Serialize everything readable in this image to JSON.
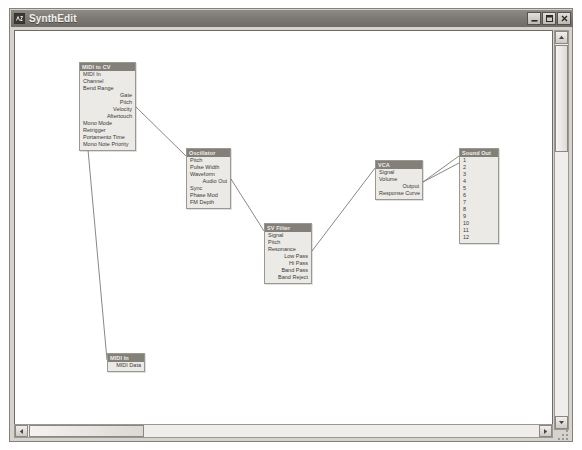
{
  "window": {
    "title": "SynthEdit",
    "icon": "app-icon",
    "controls": [
      {
        "name": "minimize-button",
        "glyph": "minimize"
      },
      {
        "name": "maximize-button",
        "glyph": "maximize"
      },
      {
        "name": "close-button",
        "glyph": "close"
      }
    ]
  },
  "colors": {
    "module_header_bg": "#838079",
    "module_body_bg": "#eceae6",
    "module_border": "#9b9892",
    "canvas_bg": "#ffffff",
    "wire": "#8b8882",
    "titlebar_bg": "#7d7a75"
  },
  "canvas": {
    "modules": [
      {
        "name": "midi-to-cv",
        "title": "MIDI to CV",
        "x": 64,
        "y": 31,
        "width": 57,
        "pins": [
          {
            "label": "MIDI In",
            "dir": "in"
          },
          {
            "label": "Channel",
            "dir": "in"
          },
          {
            "label": "Bend Range",
            "dir": "in"
          },
          {
            "label": "Gate",
            "dir": "out"
          },
          {
            "label": "Pitch",
            "dir": "out"
          },
          {
            "label": "Velocity",
            "dir": "out"
          },
          {
            "label": "Aftertouch",
            "dir": "out"
          },
          {
            "label": "Mono Mode",
            "dir": "in"
          },
          {
            "label": "Retrigger",
            "dir": "in"
          },
          {
            "label": "Portamento Time",
            "dir": "in"
          },
          {
            "label": "Mono Note Priority",
            "dir": "in"
          }
        ]
      },
      {
        "name": "oscillator",
        "title": "Oscillator",
        "x": 171,
        "y": 117,
        "width": 45,
        "pins": [
          {
            "label": "Pitch",
            "dir": "in"
          },
          {
            "label": "Pulse Width",
            "dir": "in"
          },
          {
            "label": "Waveform",
            "dir": "in"
          },
          {
            "label": "Audio Out",
            "dir": "out"
          },
          {
            "label": "Sync",
            "dir": "in"
          },
          {
            "label": "Phase Mod",
            "dir": "in"
          },
          {
            "label": "FM Depth",
            "dir": "in"
          }
        ]
      },
      {
        "name": "sv-filter",
        "title": "SV Filter",
        "x": 249,
        "y": 192,
        "width": 48,
        "pins": [
          {
            "label": "Signal",
            "dir": "in"
          },
          {
            "label": "Pitch",
            "dir": "in"
          },
          {
            "label": "Resonance",
            "dir": "in"
          },
          {
            "label": "Low Pass",
            "dir": "out"
          },
          {
            "label": "Hi Pass",
            "dir": "out"
          },
          {
            "label": "Band Pass",
            "dir": "out"
          },
          {
            "label": "Band Reject",
            "dir": "out"
          }
        ]
      },
      {
        "name": "vca",
        "title": "VCA",
        "x": 360,
        "y": 129,
        "width": 48,
        "pins": [
          {
            "label": "Signal",
            "dir": "in"
          },
          {
            "label": "Volume",
            "dir": "in"
          },
          {
            "label": "Output",
            "dir": "out"
          },
          {
            "label": "Response Curve",
            "dir": "in"
          }
        ]
      },
      {
        "name": "sound-out",
        "title": "Sound Out",
        "x": 444,
        "y": 117,
        "width": 40,
        "pins": [
          {
            "label": "1",
            "dir": "in"
          },
          {
            "label": "2",
            "dir": "in"
          },
          {
            "label": "3",
            "dir": "in"
          },
          {
            "label": "4",
            "dir": "in"
          },
          {
            "label": "5",
            "dir": "in"
          },
          {
            "label": "6",
            "dir": "in"
          },
          {
            "label": "7",
            "dir": "in"
          },
          {
            "label": "8",
            "dir": "in"
          },
          {
            "label": "9",
            "dir": "in"
          },
          {
            "label": "10",
            "dir": "in"
          },
          {
            "label": "11",
            "dir": "in"
          },
          {
            "label": "12",
            "dir": "in"
          }
        ]
      },
      {
        "name": "midi-in",
        "title": "MIDI In",
        "x": 92,
        "y": 322,
        "width": 38,
        "pins": [
          {
            "label": "MIDI Data",
            "dir": "out"
          }
        ]
      }
    ],
    "wires": [
      {
        "name": "wire-midicv-pitch-to-osc-pitch",
        "x1": 121,
        "y1": 76,
        "x2": 171,
        "y2": 125
      },
      {
        "name": "wire-midicv-midiin-to-midiin-data",
        "x1": 66,
        "y1": 41,
        "x2": 92,
        "y2": 329
      },
      {
        "name": "wire-osc-audioout-to-filter-signal",
        "x1": 216,
        "y1": 148,
        "x2": 249,
        "y2": 200
      },
      {
        "name": "wire-filter-lowpass-to-vca-signal",
        "x1": 297,
        "y1": 220,
        "x2": 360,
        "y2": 137
      },
      {
        "name": "wire-vca-output-to-soundout-1",
        "x1": 408,
        "y1": 151,
        "x2": 444,
        "y2": 125
      },
      {
        "name": "wire-vca-output-to-soundout-2",
        "x1": 408,
        "y1": 151,
        "x2": 444,
        "y2": 132
      }
    ]
  },
  "scrollbars": {
    "vertical": {
      "name": "vertical-scrollbar",
      "up": "scroll-up-arrow",
      "down": "scroll-down-arrow"
    },
    "horizontal": {
      "name": "horizontal-scrollbar",
      "left": "scroll-left-arrow",
      "right": "scroll-right-arrow"
    }
  }
}
